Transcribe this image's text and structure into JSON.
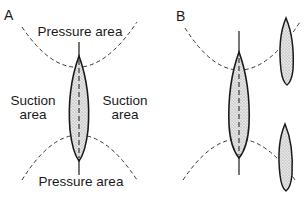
{
  "panels": [
    {
      "id": "A",
      "label": "A",
      "texts": {
        "pressure_top": "Pressure area",
        "pressure_bottom": "Pressure area",
        "suction_left_line1": "Suction",
        "suction_left_line2": "area",
        "suction_right_line1": "Suction",
        "suction_right_line2": "area"
      }
    },
    {
      "id": "B",
      "label": "B"
    }
  ],
  "colors": {
    "ink": "#1a1a1a",
    "hull_fill": "#d9d9d9",
    "dash": "#333333"
  }
}
